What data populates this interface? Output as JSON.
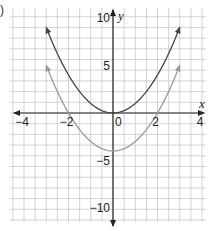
{
  "part_label": ")",
  "chart_data": {
    "type": "line",
    "title": "",
    "xlabel": "x",
    "ylabel": "y",
    "xlim": [
      -4.5,
      4.5
    ],
    "ylim": [
      -11,
      11
    ],
    "grid": true,
    "x_ticks": [
      {
        "value": -4,
        "label": "−4"
      },
      {
        "value": -2,
        "label": "−2"
      },
      {
        "value": 0,
        "label": "0"
      },
      {
        "value": 2,
        "label": "2"
      },
      {
        "value": 4,
        "label": "4"
      }
    ],
    "y_ticks": [
      {
        "value": 10,
        "label": "10"
      },
      {
        "value": 5,
        "label": "5"
      },
      {
        "value": -5,
        "label": "−5"
      },
      {
        "value": -10,
        "label": "−10"
      }
    ],
    "series": [
      {
        "name": "y = x²",
        "color": "#444444",
        "x": [
          -3,
          -2.5,
          -2,
          -1.5,
          -1,
          -0.5,
          0,
          0.5,
          1,
          1.5,
          2,
          2.5,
          3
        ],
        "values": [
          9,
          6.25,
          4,
          2.25,
          1,
          0.25,
          0,
          0.25,
          1,
          2.25,
          4,
          6.25,
          9
        ],
        "arrows": true
      },
      {
        "name": "y = x² − 4",
        "color": "#999999",
        "x": [
          -3,
          -2.5,
          -2,
          -1.5,
          -1,
          -0.5,
          0,
          0.5,
          1,
          1.5,
          2,
          2.5,
          3
        ],
        "values": [
          5,
          2.25,
          0,
          -1.75,
          -3,
          -3.75,
          -4,
          -3.75,
          -3,
          -1.75,
          0,
          2.25,
          5
        ],
        "arrows": true
      }
    ],
    "legend": null,
    "colors": {
      "grid_minor": "#c8c8c8",
      "grid_major": "#a8a8a8",
      "axis": "#222222"
    }
  }
}
